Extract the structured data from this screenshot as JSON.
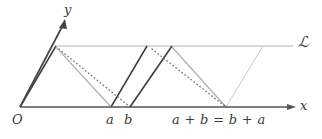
{
  "figure": {
    "background": "#ffffff",
    "axes": {
      "x_label": "x",
      "y_label": "y",
      "origin_label": "O",
      "x_axis_color": "#555555",
      "y_axis_color": "#444444"
    },
    "line_label": "ℒ",
    "tick_labels": {
      "a": "a",
      "b": "b",
      "sum": "a + b = b + a"
    },
    "colors": {
      "dark_stroke": "#3d3d3d",
      "gray_stroke": "#b0b0b0",
      "dotted_stroke": "#7a7a7a",
      "axis": "#555555",
      "text": "#3a3a3a"
    },
    "geometry": {
      "origin": [
        20,
        107
      ],
      "x_axis_end": [
        296,
        107
      ],
      "y_axis_end": [
        62,
        20
      ],
      "line_L_y": 46,
      "line_L_start_x": 56,
      "line_L_end_x": 293,
      "a_x": 111,
      "b_x": 130,
      "sum_x": 226,
      "left_parallelogram": [
        [
          20,
          107
        ],
        [
          56,
          46
        ],
        [
          147,
          46
        ],
        [
          111,
          107
        ]
      ],
      "middle_parallelogram": [
        [
          111,
          107
        ],
        [
          147,
          46
        ],
        [
          172,
          46
        ],
        [
          130,
          107
        ]
      ],
      "right_parallelogram": [
        [
          130,
          107
        ],
        [
          172,
          46
        ],
        [
          263,
          46
        ],
        [
          226,
          107
        ]
      ],
      "gray_diagonal_left": [
        [
          56,
          46
        ],
        [
          111,
          107
        ]
      ],
      "dotted_diagonal_left": [
        [
          58,
          48
        ],
        [
          130,
          107
        ]
      ],
      "gray_diagonal_right": [
        [
          172,
          46
        ],
        [
          226,
          107
        ]
      ],
      "dotted_diagonal_right": [
        [
          150,
          48
        ],
        [
          226,
          107
        ]
      ]
    }
  }
}
